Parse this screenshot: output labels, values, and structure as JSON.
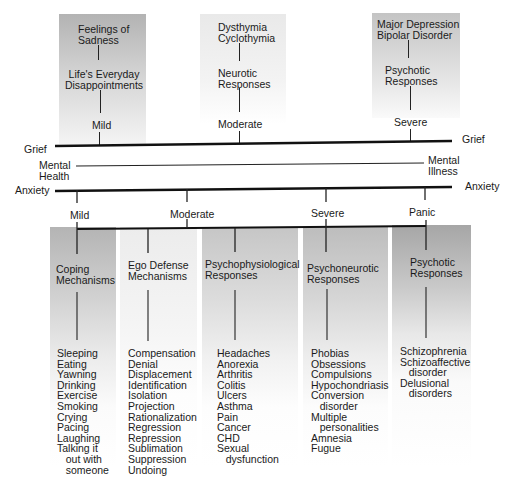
{
  "grief_scale": {
    "left_label": "Grief",
    "right_label": "Grief",
    "levels": [
      {
        "level": "Mild",
        "response": "Life's Everyday\nDisappointments",
        "example": "Feelings of\nSadness",
        "shade": "#b8b8b8"
      },
      {
        "level": "Moderate",
        "response": "Neurotic\nResponses",
        "example": "Dysthymia\nCyclothymia",
        "shade": "#e6e6e6"
      },
      {
        "level": "Severe",
        "response": "Psychotic\nResponses",
        "example": "Major Depression\nBipolar Disorder",
        "shade": "#c4c4c4"
      }
    ]
  },
  "mental_scale": {
    "left_label": "Mental\nHealth",
    "right_label": "Mental\nIllness"
  },
  "anxiety_scale": {
    "left_label": "Anxiety",
    "right_label": "Anxiety",
    "levels": [
      "Mild",
      "Moderate",
      "Severe",
      "Panic"
    ]
  },
  "response_categories": [
    {
      "title": "Coping\nMechanisms",
      "shade": "#b4b4b4",
      "items": "Sleeping\nEating\nYawning\nDrinking\nExercise\nSmoking\nCrying\nPacing\nLaughing\nTalking it\n   out with\n   someone"
    },
    {
      "title": "Ego Defense\nMechanisms",
      "shade": "#ebebeb",
      "items": "Compensation\nDenial\nDisplacement\nIdentification\nIsolation\nProjection\nRationalization\nRegression\nRepression\nSublimation\nSuppression\nUndoing"
    },
    {
      "title": "Psychophysiological\nResponses",
      "shade": "#c8c8c8",
      "items": "Headaches\nAnorexia\nArthritis\nColitis\nUlcers\nAsthma\nPain\nCancer\nCHD\nSexual\n   dysfunction"
    },
    {
      "title": "Psychoneurotic\nResponses",
      "shade": "#bdbdbd",
      "items": "Phobias\nObsessions\nCompulsions\nHypochondriasis\nConversion\n   disorder\nMultiple\n   personalities\nAmnesia\nFugue"
    },
    {
      "title": "Psychotic\nResponses",
      "shade": "#a6a6a6",
      "items": "Schizophrenia\nSchizoaffective\n   disorder\nDelusional\n   disorders"
    }
  ]
}
